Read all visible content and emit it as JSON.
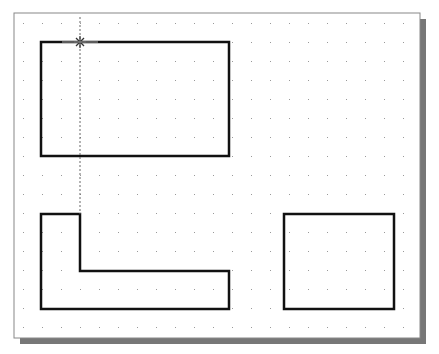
{
  "drawing": {
    "frame": {
      "x": 14,
      "y": 13,
      "w": 406,
      "h": 325,
      "shadow_offset": 6,
      "border": "#888888",
      "shadow": "#777777",
      "background": "#ffffff"
    },
    "grid": {
      "x0": 23,
      "y0": 23,
      "step": 19,
      "color": "#999999"
    },
    "stroke": "#111111",
    "shapes": [
      {
        "name": "rectangle-top-left",
        "type": "polygon",
        "points": [
          [
            41,
            42
          ],
          [
            229,
            42
          ],
          [
            229,
            156
          ],
          [
            41,
            156
          ]
        ]
      },
      {
        "name": "l-shape",
        "type": "polygon",
        "points": [
          [
            41,
            214
          ],
          [
            80,
            214
          ],
          [
            80,
            271
          ],
          [
            229,
            271
          ],
          [
            229,
            309
          ],
          [
            41,
            309
          ]
        ]
      },
      {
        "name": "rectangle-bottom-right",
        "type": "polygon",
        "points": [
          [
            284,
            214
          ],
          [
            394,
            214
          ],
          [
            394,
            309
          ],
          [
            284,
            309
          ]
        ]
      }
    ],
    "tracking_line": {
      "x": 80,
      "y1": 17,
      "y2": 214
    },
    "cursor": {
      "x": 80,
      "y": 42
    }
  }
}
